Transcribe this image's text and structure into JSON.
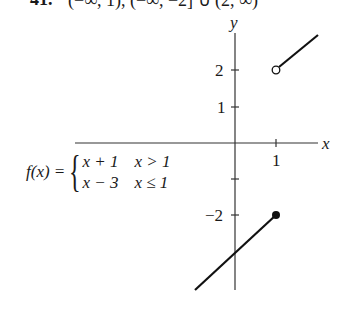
{
  "header": {
    "problem_number": "41.",
    "text": "(−∞, 1), (−∞, −2] ∪ (2, ∞)"
  },
  "axes": {
    "x_label": "x",
    "y_label": "y",
    "x_ticks": [
      {
        "value": 1,
        "label": "1"
      }
    ],
    "y_ticks": [
      {
        "value": 2,
        "label": "2"
      },
      {
        "value": 1,
        "label": "1"
      },
      {
        "value": -1,
        "label": ""
      },
      {
        "value": -2,
        "label": "−2"
      }
    ]
  },
  "function": {
    "name": "f(x) =",
    "pieces": [
      {
        "expr": "x + 1",
        "condition": "x > 1"
      },
      {
        "expr": "x − 3",
        "condition": "x ≤ 1"
      }
    ]
  },
  "graph": {
    "upper_piece": {
      "start": [
        1,
        2
      ],
      "start_marker": "open-circle",
      "end": [
        2,
        3
      ]
    },
    "lower_piece": {
      "start": [
        -1,
        -4
      ],
      "end": [
        1,
        -2
      ],
      "end_marker": "filled-circle"
    }
  },
  "colors": {
    "ink": "#1a1a1a",
    "background": "#ffffff"
  }
}
